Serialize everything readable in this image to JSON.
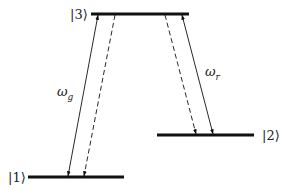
{
  "diagram": {
    "colors": {
      "line": "#111111",
      "text": "#222222",
      "background": "#ffffff"
    },
    "levels": [
      {
        "id": "level-3",
        "label": "|3⟩",
        "x1": 91,
        "x2": 189,
        "y": 14,
        "label_x": 70,
        "label_y": 19,
        "label_anchor": "start"
      },
      {
        "id": "level-2",
        "label": "|2⟩",
        "x1": 157,
        "x2": 254,
        "y": 135,
        "label_x": 262,
        "label_y": 140,
        "label_anchor": "start"
      },
      {
        "id": "level-1",
        "label": "|1⟩",
        "x1": 28,
        "x2": 124,
        "y": 177,
        "label_x": 8,
        "label_y": 182,
        "label_anchor": "start"
      }
    ],
    "transitions": [
      {
        "id": "pump-g",
        "style": "solid",
        "heads": "both",
        "from": [
          98,
          15
        ],
        "to": [
          68,
          176
        ],
        "connects": "|1⟩ ↔ |3⟩"
      },
      {
        "id": "decay-31",
        "style": "dashed",
        "heads": "end",
        "from": [
          115,
          15
        ],
        "to": [
          84,
          176
        ],
        "connects": "|3⟩ → |1⟩"
      },
      {
        "id": "decay-32",
        "style": "dashed",
        "heads": "end",
        "from": [
          165,
          15
        ],
        "to": [
          196,
          134
        ],
        "connects": "|3⟩ → |2⟩"
      },
      {
        "id": "pump-r",
        "style": "solid",
        "heads": "both",
        "from": [
          182,
          15
        ],
        "to": [
          213,
          134
        ],
        "connects": "|2⟩ ↔ |3⟩"
      }
    ],
    "frequency_labels": [
      {
        "id": "omega-g",
        "symbol": "ω",
        "subscript": "g",
        "x": 57,
        "y": 96
      },
      {
        "id": "omega-r",
        "symbol": "ω",
        "subscript": "r",
        "x": 205,
        "y": 76
      }
    ]
  }
}
